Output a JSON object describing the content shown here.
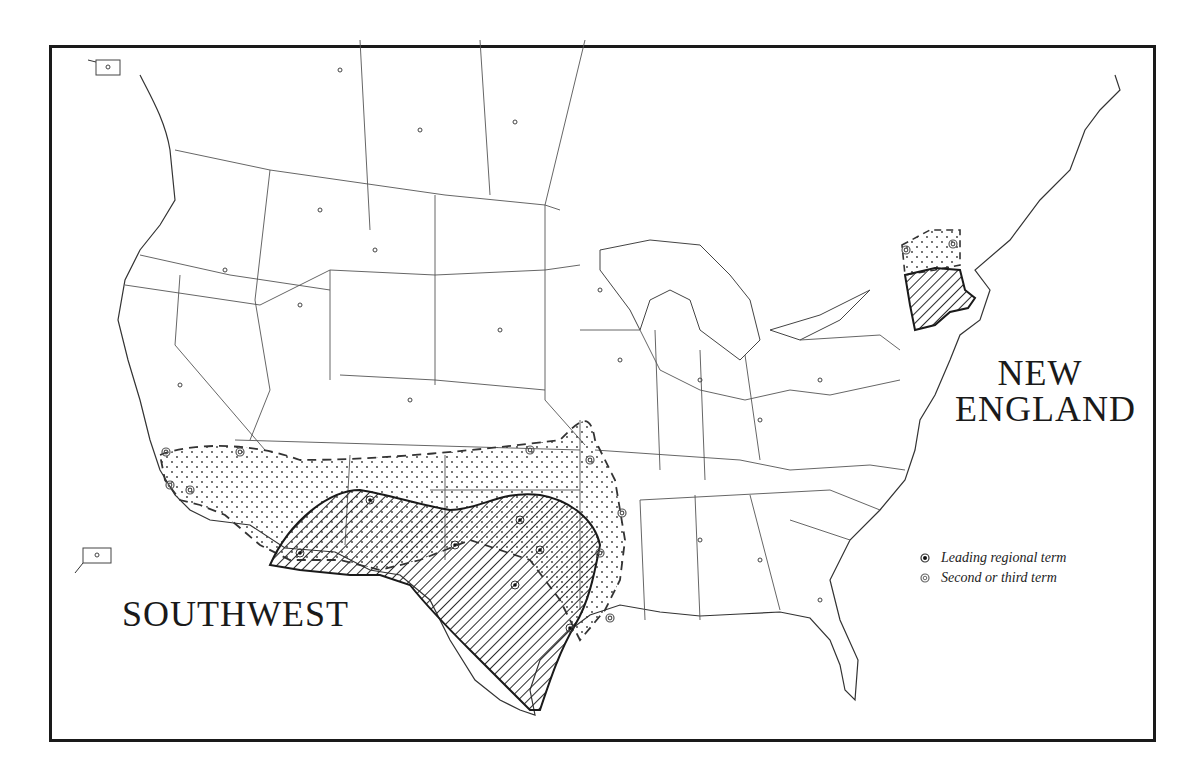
{
  "map": {
    "title": "",
    "regions": [
      {
        "id": "new-england",
        "label_lines": [
          "NEW",
          "ENGLAND"
        ]
      },
      {
        "id": "southwest",
        "label": "SOUTHWEST"
      }
    ],
    "legend": {
      "items": [
        {
          "symbol": "filled-dot-circle",
          "label": "Leading regional term"
        },
        {
          "symbol": "ring-circle",
          "label": "Second or third term"
        }
      ]
    },
    "insets": [
      {
        "id": "alaska-inset"
      },
      {
        "id": "hawaii-inset"
      }
    ],
    "colors": {
      "ink": "#1a1a1a",
      "paper": "#ffffff",
      "hatch": "#2a2a2a"
    }
  }
}
